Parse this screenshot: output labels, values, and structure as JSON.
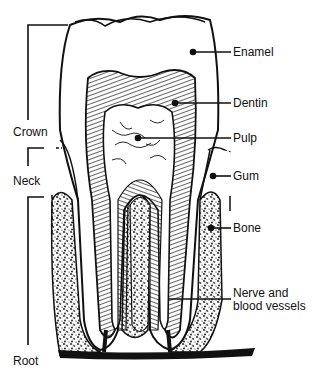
{
  "labels": {
    "enamel": "Enamel",
    "dentin": "Dentin",
    "pulp": "Pulp",
    "gum": "Gum",
    "bone": "Bone",
    "nerve_line1": "Nerve and",
    "nerve_line2": "blood vessels"
  },
  "regions": {
    "crown": "Crown",
    "neck": "Neck",
    "root": "Root"
  },
  "colors": {
    "ink": "#111111",
    "background": "#ffffff"
  }
}
